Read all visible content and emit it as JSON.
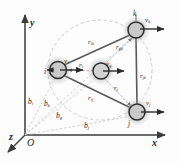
{
  "figure": {
    "background_color": "#fdfdfd",
    "ink_color": "#1d1d1d",
    "axis_color": "#4a4a4a",
    "link_color": "#5a5a5a",
    "dashed_color": "#b4b4b4",
    "node_fill": "#c9c9c9",
    "node_stroke": "#2b2b2b"
  },
  "axes": {
    "origin_label": "O",
    "x_label": "x",
    "y_label": "y",
    "z_label": "z"
  },
  "nodes": [
    {
      "id": "i",
      "label": "i",
      "cx": 58,
      "cy": 70,
      "r": 8.5
    },
    {
      "id": "g",
      "label": "g",
      "cx": 101,
      "cy": 71,
      "r": 8.0
    },
    {
      "id": "k",
      "label": "k",
      "cx": 136,
      "cy": 30,
      "r": 8.0
    },
    {
      "id": "j",
      "label": "j",
      "cx": 137,
      "cy": 112,
      "r": 8.0
    }
  ],
  "velocity_vectors": [
    {
      "name": "v_i",
      "base": "v",
      "sub": "i"
    },
    {
      "name": "v_g",
      "base": "v",
      "sub": "g"
    },
    {
      "name": "v_k",
      "base": "v",
      "sub": "k"
    },
    {
      "name": "v_j",
      "base": "v",
      "sub": "j"
    }
  ],
  "relative_vectors": [
    {
      "name": "r_ik",
      "base": "r",
      "sub": "ik"
    },
    {
      "name": "r_ij",
      "base": "r",
      "sub": "ij"
    },
    {
      "name": "r_jk",
      "base": "r",
      "sub": "jk"
    },
    {
      "name": "r_gk",
      "base": "r",
      "sub": "gk"
    },
    {
      "name": "r_i",
      "base": "r",
      "sub": "i"
    },
    {
      "name": "r_g",
      "base": "r",
      "sub": "g"
    },
    {
      "name": "r_j",
      "base": "r",
      "sub": "j"
    }
  ],
  "position_vectors": [
    {
      "name": "b_i",
      "base": "b",
      "sub": "i"
    },
    {
      "name": "b_k",
      "base": "b",
      "sub": "k"
    },
    {
      "name": "b_g",
      "base": "b",
      "sub": "g"
    },
    {
      "name": "b_j",
      "base": "b",
      "sub": "j"
    }
  ],
  "labels": {
    "x": "x",
    "y": "y",
    "z": "z",
    "O": "O",
    "i": "i",
    "g": "g",
    "k": "k",
    "j": "j",
    "v_base": "v",
    "r_base": "r",
    "b_base": "b",
    "sub_i": "i",
    "sub_g": "g",
    "sub_j": "j",
    "sub_k": "k",
    "sub_ik": "ik",
    "sub_ij": "ij",
    "sub_jk": "jk",
    "sub_gk": "gk"
  }
}
